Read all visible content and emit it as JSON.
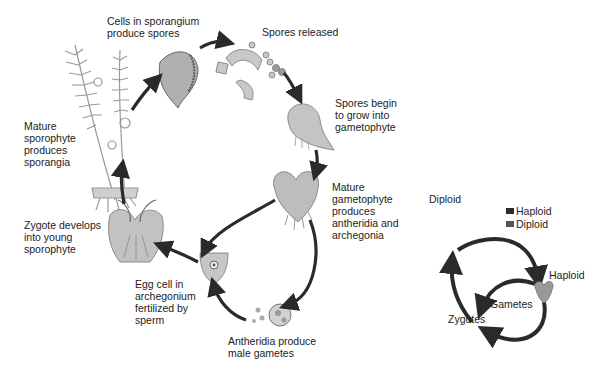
{
  "diagram": {
    "stages": [
      {
        "id": "sporangium",
        "label": "Cells in sporangium\nproduce spores"
      },
      {
        "id": "spores_released",
        "label": "Spores released"
      },
      {
        "id": "spores_grow",
        "label": "Spores begin\nto grow into\ngametophyte"
      },
      {
        "id": "mature_gametophyte",
        "label": "Mature\ngametophyte\nproduces\nantheridia and\narchegonia"
      },
      {
        "id": "antheridia",
        "label": "Antheridia produce\nmale gametes"
      },
      {
        "id": "egg_fertilized",
        "label": "Egg cell in\narchegonium\nfertilized by\nsperm"
      },
      {
        "id": "zygote",
        "label": "Zygote develops\ninto young\nsporophyte"
      },
      {
        "id": "mature_sporophyte",
        "label": "Mature\nsporophyte\nproduces\nsporangia"
      }
    ],
    "inset": {
      "diploid_label": "Diploid",
      "haploid_label": "Haploid",
      "gametes_label": "Gametes",
      "zygotes_label": "Zygotes",
      "legend": [
        {
          "label": "Haploid",
          "color": "#2b2b2b"
        },
        {
          "label": "Diploid",
          "color": "#555555"
        }
      ]
    },
    "colors": {
      "arrow": "#2a2a2a",
      "illustration": "#8a8a8a",
      "background": "#ffffff"
    }
  }
}
